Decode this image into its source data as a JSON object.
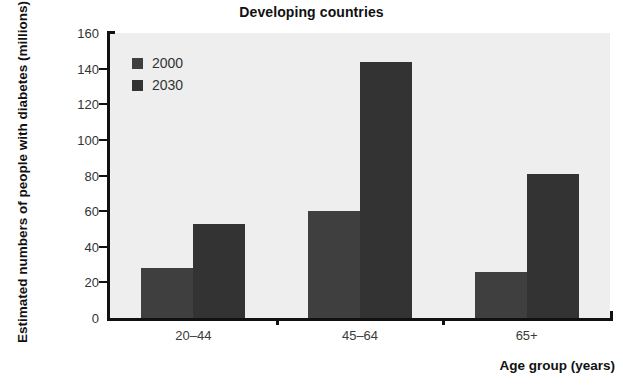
{
  "chart_data": {
    "type": "bar",
    "title": "Developing countries",
    "xlabel": "Age group (years)",
    "ylabel": "Estimated numbers of people with diabetes (millions)",
    "categories": [
      "20–44",
      "45–64",
      "65+"
    ],
    "series": [
      {
        "name": "2000",
        "values": [
          28,
          60,
          26
        ],
        "color": "#3f3f3f"
      },
      {
        "name": "2030",
        "values": [
          53,
          144,
          81
        ],
        "color": "#333333"
      }
    ],
    "ylim": [
      0,
      160
    ],
    "yticks": [
      0,
      20,
      40,
      60,
      80,
      100,
      120,
      140,
      160
    ],
    "ytick_labels": [
      "0",
      "20",
      "40",
      "60",
      "80",
      "100",
      "120",
      "140",
      "160"
    ],
    "grid": false,
    "legend_position": "upper-left-inside",
    "plot_background": "#eeeeee",
    "axis_color": "#111111"
  }
}
